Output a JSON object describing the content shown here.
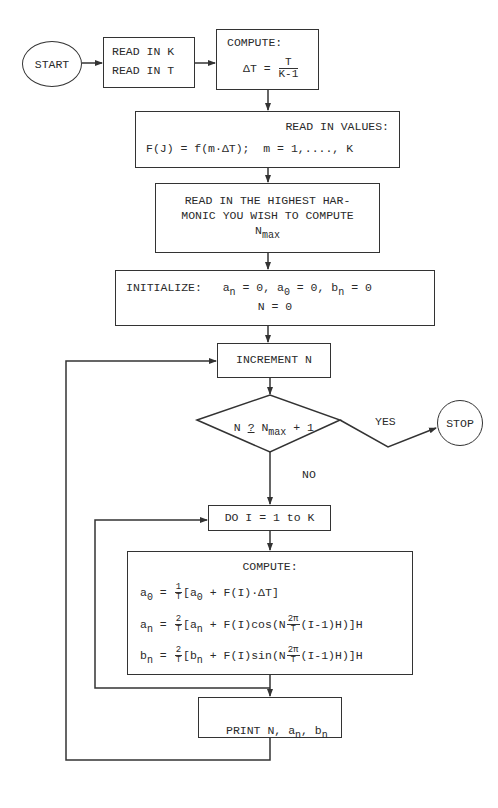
{
  "diagram": {
    "type": "flowchart",
    "nodes": {
      "start": {
        "label": "START"
      },
      "read_inputs": {
        "line1": "READ IN K",
        "line2": "READ IN T"
      },
      "compute_dt": {
        "title": "COMPUTE:",
        "lhs": "ΔT =",
        "num": "T",
        "den": "K-1"
      },
      "read_values": {
        "title": "READ IN VALUES:",
        "formula": "F(J) = f(m·ΔT);  m = 1,...., K"
      },
      "read_harmonic": {
        "line1": "READ IN THE HIGHEST HAR-",
        "line2": "MONIC YOU WISH TO COMPUTE",
        "var": "N",
        "var_sub": "max"
      },
      "initialize": {
        "label": "INITIALIZE:",
        "a": "a",
        "a_sub": "n",
        "eq1": " = 0, ",
        "a0": "a",
        "a0_sub": "0",
        "eq2": " = 0, ",
        "b": "b",
        "b_sub": "n",
        "eq3": " = 0",
        "line2": "N = 0"
      },
      "increment": {
        "label": "INCREMENT N"
      },
      "decision": {
        "left": "N ",
        "op": "?",
        "var": " N",
        "var_sub": "max",
        "right": " + 1"
      },
      "yes_label": "YES",
      "no_label": "NO",
      "stop": {
        "label": "STOP"
      },
      "do_loop": {
        "label": "DO I = 1 to K"
      },
      "compute_coeffs": {
        "title": "COMPUTE:",
        "a0": {
          "lhs": "a",
          "lhs_sub": "0",
          "eq": " = ",
          "num": "1",
          "den": "T",
          "body_pre": "[a",
          "body_sub": "0",
          "body_post": " + F(I)·ΔT]"
        },
        "an": {
          "lhs": "a",
          "lhs_sub": "n",
          "eq": " = ",
          "num": "2",
          "den": "T",
          "body_pre": "[a",
          "body_sub": "n",
          "body_mid": " + F(I)cos(N",
          "inner_num": "2π",
          "inner_den": "T",
          "body_post": "(I-1)H)]H"
        },
        "bn": {
          "lhs": "b",
          "lhs_sub": "n",
          "eq": " = ",
          "num": "2",
          "den": "T",
          "body_pre": "[b",
          "body_sub": "n",
          "body_mid": " + F(I)sin(N",
          "inner_num": "2π",
          "inner_den": "T",
          "body_post": "(I-1)H)]H"
        }
      },
      "print": {
        "pre": "PRINT N, a",
        "sub1": "n",
        "mid": ", b",
        "sub2": "n"
      }
    }
  }
}
